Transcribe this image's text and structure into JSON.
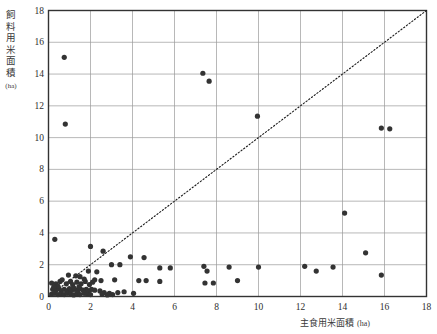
{
  "chart_data": {
    "type": "scatter",
    "title": "",
    "xlabel": "主食用米面積",
    "xlabel_unit": "(ha)",
    "ylabel": "飼料用米面積",
    "ylabel_unit": "(ha)",
    "xlim": [
      0,
      18
    ],
    "ylim": [
      0,
      18
    ],
    "xticks": [
      0,
      2,
      4,
      6,
      8,
      10,
      12,
      14,
      16,
      18
    ],
    "yticks": [
      0,
      2,
      4,
      6,
      8,
      10,
      12,
      14,
      16,
      18
    ],
    "xtick_labels": [
      "0",
      "2",
      "4",
      "6",
      "8",
      "10",
      "12",
      "14",
      "16",
      "18"
    ],
    "ytick_labels": [
      "0",
      "2",
      "4",
      "6",
      "8",
      "10",
      "12",
      "14",
      "16",
      "18"
    ],
    "grid": true,
    "grid_color": "#9a9a9a",
    "legend": "none",
    "marker_color": "#333333",
    "marker_size": 5.2,
    "reference_line": {
      "label": "y = x",
      "style": "dotted",
      "color": "#1a1a1a",
      "from": [
        0,
        0
      ],
      "to": [
        18,
        18
      ]
    },
    "points": [
      [
        0.75,
        15.05
      ],
      [
        0.8,
        10.85
      ],
      [
        7.35,
        14.05
      ],
      [
        7.65,
        13.55
      ],
      [
        9.95,
        11.35
      ],
      [
        15.85,
        10.6
      ],
      [
        16.25,
        10.55
      ],
      [
        14.1,
        5.25
      ],
      [
        15.1,
        2.75
      ],
      [
        15.85,
        1.35
      ],
      [
        0.3,
        3.6
      ],
      [
        2.0,
        3.15
      ],
      [
        2.6,
        2.85
      ],
      [
        3.9,
        2.5
      ],
      [
        4.55,
        2.45
      ],
      [
        3.0,
        2.0
      ],
      [
        3.4,
        2.0
      ],
      [
        1.9,
        1.6
      ],
      [
        2.3,
        1.55
      ],
      [
        5.3,
        1.8
      ],
      [
        5.8,
        1.8
      ],
      [
        7.4,
        1.9
      ],
      [
        7.55,
        1.6
      ],
      [
        8.6,
        1.85
      ],
      [
        10.0,
        1.85
      ],
      [
        12.2,
        1.9
      ],
      [
        12.75,
        1.6
      ],
      [
        13.55,
        1.85
      ],
      [
        0.95,
        1.35
      ],
      [
        1.3,
        1.3
      ],
      [
        1.5,
        1.25
      ],
      [
        1.7,
        1.1
      ],
      [
        2.2,
        1.05
      ],
      [
        2.5,
        1.0
      ],
      [
        3.15,
        1.05
      ],
      [
        4.3,
        1.0
      ],
      [
        4.65,
        1.0
      ],
      [
        5.3,
        0.95
      ],
      [
        7.45,
        0.85
      ],
      [
        7.85,
        0.85
      ],
      [
        9.0,
        1.0
      ],
      [
        0.15,
        0.85
      ],
      [
        0.35,
        0.8
      ],
      [
        0.55,
        0.95
      ],
      [
        0.65,
        1.05
      ],
      [
        0.85,
        0.8
      ],
      [
        1.05,
        0.95
      ],
      [
        1.15,
        0.75
      ],
      [
        1.35,
        0.9
      ],
      [
        1.55,
        0.8
      ],
      [
        1.75,
        0.95
      ],
      [
        1.95,
        0.75
      ],
      [
        2.1,
        0.9
      ],
      [
        0.2,
        0.45
      ],
      [
        0.35,
        0.4
      ],
      [
        0.5,
        0.5
      ],
      [
        0.6,
        0.35
      ],
      [
        0.75,
        0.45
      ],
      [
        0.9,
        0.35
      ],
      [
        1.0,
        0.5
      ],
      [
        1.1,
        0.4
      ],
      [
        1.25,
        0.45
      ],
      [
        1.4,
        0.35
      ],
      [
        1.5,
        0.5
      ],
      [
        1.65,
        0.4
      ],
      [
        1.8,
        0.45
      ],
      [
        1.9,
        0.35
      ],
      [
        2.05,
        0.45
      ],
      [
        2.2,
        0.4
      ],
      [
        0.15,
        0.15
      ],
      [
        0.3,
        0.2
      ],
      [
        0.45,
        0.12
      ],
      [
        0.6,
        0.18
      ],
      [
        0.75,
        0.12
      ],
      [
        0.9,
        0.2
      ],
      [
        1.05,
        0.15
      ],
      [
        1.2,
        0.1
      ],
      [
        1.35,
        0.18
      ],
      [
        1.5,
        0.12
      ],
      [
        1.7,
        0.2
      ],
      [
        1.85,
        0.15
      ],
      [
        2.0,
        0.12
      ],
      [
        2.45,
        0.35
      ],
      [
        2.65,
        0.25
      ],
      [
        2.9,
        0.2
      ],
      [
        3.3,
        0.25
      ],
      [
        3.6,
        0.3
      ],
      [
        4.05,
        0.2
      ],
      [
        2.55,
        0.15
      ],
      [
        2.8,
        0.1
      ],
      [
        3.05,
        0.12
      ],
      [
        1.2,
        0.55
      ],
      [
        1.45,
        0.6
      ],
      [
        0.45,
        0.65
      ],
      [
        0.25,
        0.6
      ]
    ]
  },
  "axis_titles": {
    "y_chars": [
      "飼",
      "料",
      "用",
      "米",
      "面",
      "積"
    ],
    "y_unit": "(ha)",
    "x_text": "主食用米面積",
    "x_unit": "(ha)"
  },
  "caption_fragment": ""
}
